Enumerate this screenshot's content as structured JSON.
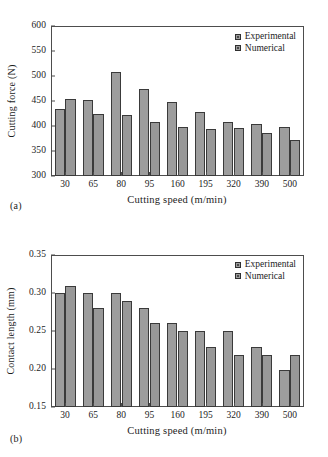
{
  "figure": {
    "panels": [
      {
        "sublabel": "(a)",
        "legend": [
          "Experimental",
          "Numerical"
        ],
        "chart_data": {
          "type": "bar",
          "title": "",
          "xlabel": "Cutting speed (m/min)",
          "ylabel": "Cutting force (N)",
          "categories": [
            "30",
            "65",
            "80",
            "95",
            "160",
            "195",
            "320",
            "390",
            "500"
          ],
          "series": [
            {
              "name": "Experimental",
              "values": [
                435,
                453,
                509,
                474,
                449,
                429,
                409,
                404,
                399
              ]
            },
            {
              "name": "Numerical",
              "values": [
                455,
                424,
                422,
                408,
                398,
                395,
                396,
                386,
                373
              ]
            }
          ],
          "ylim": [
            300,
            600
          ],
          "yticks": [
            300,
            350,
            400,
            450,
            500,
            550,
            600
          ],
          "ytick_labels": [
            "300",
            "350",
            "400",
            "450",
            "500",
            "550",
            "600"
          ],
          "grid": false,
          "legend_position": "top-right"
        }
      },
      {
        "sublabel": "(b)",
        "legend": [
          "Experimental",
          "Numerical"
        ],
        "chart_data": {
          "type": "bar",
          "title": "",
          "xlabel": "Cutting speed (m/min)",
          "ylabel": "Contact length (mm)",
          "categories": [
            "30",
            "65",
            "80",
            "95",
            "160",
            "195",
            "320",
            "390",
            "500"
          ],
          "series": [
            {
              "name": "Experimental",
              "values": [
                0.3,
                0.3,
                0.3,
                0.28,
                0.26,
                0.25,
                0.25,
                0.229,
                0.199
              ]
            },
            {
              "name": "Numerical",
              "values": [
                0.309,
                0.28,
                0.29,
                0.26,
                0.25,
                0.229,
                0.219,
                0.219,
                0.219
              ]
            }
          ],
          "ylim": [
            0.15,
            0.35
          ],
          "yticks": [
            0.15,
            0.2,
            0.25,
            0.3,
            0.35
          ],
          "ytick_labels": [
            "0.15",
            "0.20",
            "0.25",
            "0.30",
            "0.35"
          ],
          "grid": false,
          "legend_position": "top-right"
        }
      }
    ],
    "colors": {
      "bar_fill": "#9d9d9d",
      "bar_border": "#3a3a3a",
      "axis": "#4d4d4d",
      "text": "#1c1c1c",
      "background": "#ffffff"
    }
  }
}
